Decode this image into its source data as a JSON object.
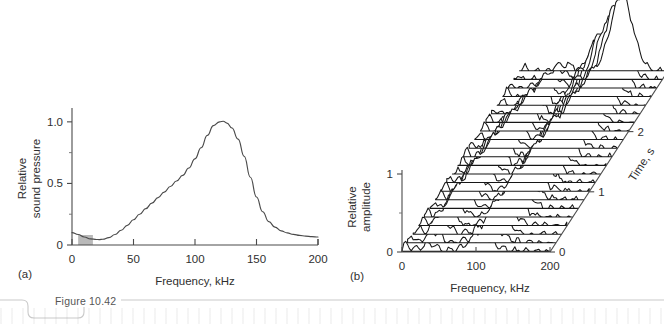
{
  "figure": {
    "caption_tab": "Figure 10.42",
    "panel_a_letter": "(a)",
    "panel_b_letter": "(b)"
  },
  "chart_data": [
    {
      "id": "panel-a",
      "type": "line",
      "title": "",
      "xlabel": "Frequency, kHz",
      "ylabel": "Relative sound pressure",
      "ylabel_lines": [
        "Relative",
        "sound pressure"
      ],
      "xlim": [
        0,
        200
      ],
      "ylim": [
        0,
        1.08
      ],
      "xticks": [
        0,
        50,
        100,
        150,
        200
      ],
      "xticklabels": [
        "0",
        "50",
        "100",
        "150",
        "200"
      ],
      "yticks": [
        0,
        0.5,
        1.0
      ],
      "yticklabels": [
        "0",
        "0.5",
        "1.0"
      ],
      "y_minor_ticks": [
        0.25,
        0.75
      ],
      "grid": false,
      "legend": "none",
      "highlight_band": {
        "x0": 5,
        "x1": 17,
        "color": "#b9b9b9"
      },
      "x": [
        0,
        5,
        10,
        15,
        20,
        22,
        25,
        30,
        35,
        40,
        45,
        50,
        55,
        60,
        65,
        70,
        75,
        80,
        85,
        90,
        95,
        100,
        105,
        110,
        115,
        120,
        123,
        126,
        130,
        135,
        140,
        145,
        150,
        155,
        160,
        165,
        170,
        175,
        180,
        185,
        190,
        195,
        200
      ],
      "values": [
        0.1,
        0.085,
        0.065,
        0.05,
        0.045,
        0.044,
        0.047,
        0.06,
        0.085,
        0.12,
        0.16,
        0.205,
        0.25,
        0.295,
        0.34,
        0.385,
        0.43,
        0.475,
        0.52,
        0.565,
        0.625,
        0.7,
        0.79,
        0.89,
        0.97,
        1.0,
        1.005,
        0.99,
        0.95,
        0.86,
        0.72,
        0.55,
        0.39,
        0.27,
        0.19,
        0.145,
        0.115,
        0.098,
        0.086,
        0.078,
        0.072,
        0.068,
        0.065
      ]
    },
    {
      "id": "panel-b",
      "type": "line",
      "title": "",
      "xlabel": "Frequency, kHz",
      "ylabel": "Relative amplitude",
      "ylabel_lines": [
        "Relative",
        "amplitude"
      ],
      "zlabel": "Time, s",
      "xlim": [
        0,
        200
      ],
      "ylim": [
        0,
        1.0
      ],
      "zlim": [
        0,
        3
      ],
      "xticks": [
        0,
        100,
        200
      ],
      "xticklabels": [
        "0",
        "100",
        "200"
      ],
      "yticks": [
        0,
        1
      ],
      "yticklabels": [
        "0",
        "1"
      ],
      "y_minor_ticks": [
        0.5
      ],
      "zticks": [
        0,
        1,
        2,
        3
      ],
      "zticklabels": [
        "0",
        "1",
        "2",
        "3"
      ],
      "grid": false,
      "legend": "none",
      "projection": "waterfall",
      "trace_count": 22,
      "series_note": "Echo spectra stacked over time; peak sweeps from ~110 kHz to ~135 kHz as amplitude grows toward later times."
    }
  ]
}
